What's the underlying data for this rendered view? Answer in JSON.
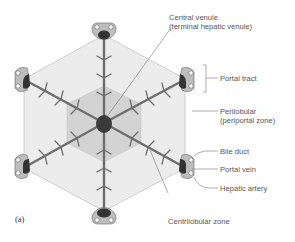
{
  "figure": {
    "panel_label": "(a)"
  },
  "labels": {
    "central_venule_line1": "Central venule",
    "central_venule_line2": "(terminal hepatic venule)",
    "portal_tract": "Portal tract",
    "perilobular_line1": "Perilobular",
    "perilobular_line2": "(periportal zone)",
    "bile_duct": "Bile duct",
    "portal_vein": "Portal vein",
    "hepatic_artery": "Hepatic artery",
    "centrilobular_zone": "Centrilobular zone"
  },
  "colors": {
    "outer_lobule": "#ececec",
    "inner_zone": "#d2d2d2",
    "vessel": "#6e6e6e",
    "vein_dark": "#333333",
    "text": "#555555",
    "edges": "#bdbdbd"
  }
}
